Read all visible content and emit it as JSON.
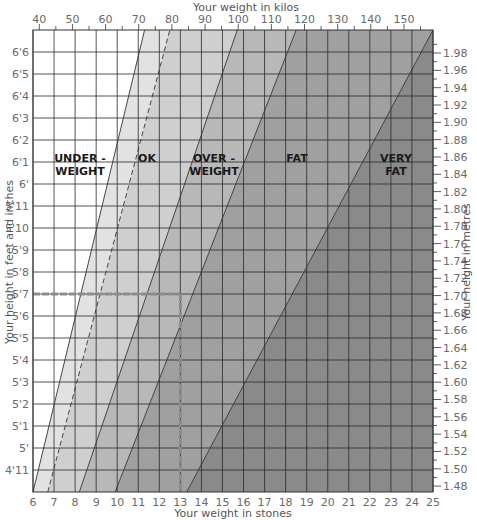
{
  "chart_data": {
    "type": "area",
    "title": "",
    "xlabel": "Your weight in stones",
    "x2label": "Your weight in kilos",
    "ylabel": "Your height in feet and inches",
    "y2label": "Your height in metres",
    "x_ticks_stones": [
      "6",
      "7",
      "8",
      "9",
      "10",
      "11",
      "12",
      "13",
      "14",
      "15",
      "16",
      "17",
      "18",
      "19",
      "20",
      "21",
      "22",
      "23",
      "24",
      "25"
    ],
    "x_ticks_kilos": [
      "40",
      "50",
      "60",
      "70",
      "80",
      "90",
      "100",
      "110",
      "120",
      "130",
      "140",
      "150"
    ],
    "y_ticks_feet": [
      "6'6",
      "6'5",
      "6'4",
      "6'3",
      "6'2",
      "6'1",
      "6'",
      "5'11",
      "5'10",
      "5'9",
      "5'8",
      "5'7",
      "5'6",
      "5'5",
      "5'4",
      "5'3",
      "5'2",
      "5'1",
      "5'",
      "4'11"
    ],
    "y_ticks_metres": [
      "1.98",
      "1.96",
      "1.94",
      "1.92",
      "1.90",
      "1.88",
      "1.86",
      "1.84",
      "1.82",
      "1.80",
      "1.78",
      "1.76",
      "1.74",
      "1.72",
      "1.70",
      "1.68",
      "1.66",
      "1.64",
      "1.62",
      "1.60",
      "1.58",
      "1.56",
      "1.54",
      "1.52",
      "1.50",
      "1.48"
    ],
    "xlim_stones": [
      6,
      25
    ],
    "xlim_kilos": [
      38,
      159
    ],
    "ylim_inches": [
      58,
      79
    ],
    "grid": true,
    "zones": [
      {
        "label": "UNDER-WEIGHT",
        "line1": "UNDER -",
        "line2": "WEIGHT",
        "color": "#ffffff"
      },
      {
        "label": "OK",
        "line1": "OK",
        "line2": "",
        "color": "#e2e2e2",
        "color_right": "#cfcfcf"
      },
      {
        "label": "OVER-WEIGHT",
        "line1": "OVER -",
        "line2": "WEIGHT",
        "color": "#b8b8b8"
      },
      {
        "label": "FAT",
        "line1": "FAT",
        "line2": "",
        "color": "#a0a0a0"
      },
      {
        "label": "VERY FAT",
        "line1": "VERY",
        "line2": "FAT",
        "color": "#8a8a8a"
      }
    ],
    "boundaries": [
      {
        "name": "underweight-ok",
        "style": "solid",
        "stones_at_4ft10": 6.0,
        "stones_at_6ft7": 11.3
      },
      {
        "name": "ok-inner",
        "style": "dashed",
        "stones_at_4ft10": 6.7,
        "stones_at_6ft7": 12.5
      },
      {
        "name": "ok-overweight",
        "style": "solid",
        "stones_at_4ft10": 8.2,
        "stones_at_6ft7": 15.7
      },
      {
        "name": "overweight-fat",
        "style": "solid",
        "stones_at_4ft10": 9.9,
        "stones_at_6ft7": 18.5
      },
      {
        "name": "fat-veryfat",
        "style": "solid",
        "stones_at_4ft10": 13.3,
        "stones_at_6ft7": 25.0
      }
    ],
    "annotation": {
      "description": "Dashed marker lines showing example: height 5'7 and weight 13 stone",
      "height": "5'7",
      "weight_stones": 13,
      "color": "#8c8c8c"
    }
  }
}
